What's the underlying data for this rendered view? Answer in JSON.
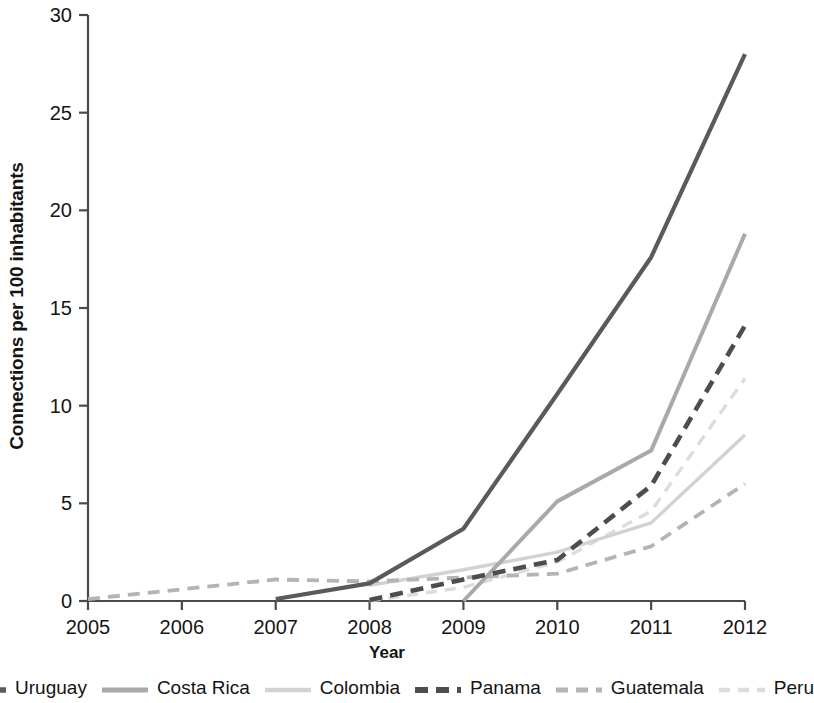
{
  "chart_data": {
    "type": "line",
    "title": "",
    "xlabel": "Year",
    "ylabel": "Connections per 100 inhabitants",
    "x": [
      2005,
      2006,
      2007,
      2008,
      2009,
      2010,
      2011,
      2012
    ],
    "xtick_labels": [
      "2005",
      "2006",
      "2007",
      "2008",
      "2009",
      "2010",
      "2011",
      "2012"
    ],
    "ytick_labels": [
      "0",
      "5",
      "10",
      "15",
      "20",
      "25",
      "30"
    ],
    "yticks": [
      0,
      5,
      10,
      15,
      20,
      25,
      30
    ],
    "xlim": [
      2005,
      2012
    ],
    "ylim": [
      0,
      30
    ],
    "grid": false,
    "legend_position": "bottom",
    "series": [
      {
        "name": "Uruguay",
        "style": "solid",
        "color": "#5a5a5a",
        "width": 4.2,
        "x": [
          2007,
          2008,
          2009,
          2010,
          2011,
          2012
        ],
        "values": [
          0.1,
          0.9,
          3.7,
          10.6,
          17.6,
          28.0
        ]
      },
      {
        "name": "Costa Rica",
        "style": "solid",
        "color": "#a9a9a9",
        "width": 4.0,
        "x": [
          2009,
          2010,
          2011,
          2012
        ],
        "values": [
          0.0,
          5.1,
          7.7,
          18.8
        ]
      },
      {
        "name": "Colombia",
        "style": "solid",
        "color": "#d2d2d2",
        "width": 3.4,
        "x": [
          2008,
          2009,
          2010,
          2011,
          2012
        ],
        "values": [
          0.8,
          1.6,
          2.5,
          4.0,
          8.5
        ]
      },
      {
        "name": "Panama",
        "style": "dashed",
        "color": "#4d4d4d",
        "width": 4.6,
        "dash": "13,8",
        "x": [
          2008,
          2009,
          2010,
          2011,
          2012
        ],
        "values": [
          0.05,
          1.1,
          2.1,
          5.9,
          14.1
        ]
      },
      {
        "name": "Guatemala",
        "style": "dashed",
        "color": "#b4b4b4",
        "width": 3.8,
        "dash": "12,8",
        "x": [
          2005,
          2006,
          2007,
          2008,
          2009,
          2010,
          2011,
          2012
        ],
        "values": [
          0.1,
          0.6,
          1.1,
          1.0,
          1.2,
          1.4,
          2.8,
          6.0
        ]
      },
      {
        "name": "Peru",
        "style": "dashed",
        "color": "#dcdcdc",
        "width": 3.4,
        "dash": "11,8",
        "x": [
          2008,
          2009,
          2010,
          2011,
          2012
        ],
        "values": [
          0.0,
          0.7,
          2.0,
          4.6,
          11.4
        ]
      }
    ]
  },
  "legend": {
    "items": [
      {
        "label": "Uruguay"
      },
      {
        "label": "Costa Rica"
      },
      {
        "label": "Colombia"
      },
      {
        "label": "Panama"
      },
      {
        "label": "Guatemala"
      },
      {
        "label": "Peru"
      }
    ]
  }
}
